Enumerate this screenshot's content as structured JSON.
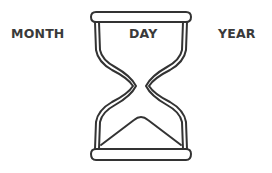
{
  "labels": {
    "left": "MONTH",
    "center": "DAY",
    "right": "YEAR"
  },
  "illustration": {
    "icon": "hourglass-icon",
    "stroke_color": "#333333",
    "background": "#ffffff"
  }
}
